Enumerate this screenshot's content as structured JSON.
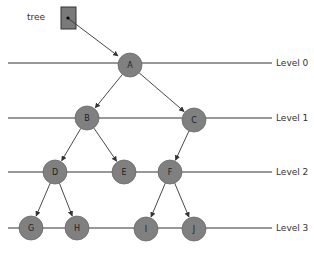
{
  "pointer": {
    "label": "tree"
  },
  "levels": [
    {
      "label": "Level 0",
      "y": 63
    },
    {
      "label": "Level 1",
      "y": 118
    },
    {
      "label": "Level 2",
      "y": 172
    },
    {
      "label": "Level 3",
      "y": 228
    }
  ],
  "nodes": [
    {
      "id": "A",
      "label": "A",
      "x": 130,
      "y": 65
    },
    {
      "id": "B",
      "label": "B",
      "x": 87,
      "y": 118
    },
    {
      "id": "C",
      "label": "C",
      "x": 194,
      "y": 120
    },
    {
      "id": "D",
      "label": "D",
      "x": 55,
      "y": 172
    },
    {
      "id": "E",
      "label": "E",
      "x": 124,
      "y": 172
    },
    {
      "id": "F",
      "label": "F",
      "x": 170,
      "y": 172
    },
    {
      "id": "G",
      "label": "G",
      "x": 31,
      "y": 228
    },
    {
      "id": "H",
      "label": "H",
      "x": 77,
      "y": 228
    },
    {
      "id": "I",
      "label": "I",
      "x": 146,
      "y": 229
    },
    {
      "id": "J",
      "label": "J",
      "x": 194,
      "y": 229
    }
  ],
  "edges": [
    [
      "A",
      "B"
    ],
    [
      "A",
      "C"
    ],
    [
      "B",
      "D"
    ],
    [
      "B",
      "E"
    ],
    [
      "C",
      "F"
    ],
    [
      "D",
      "G"
    ],
    [
      "D",
      "H"
    ],
    [
      "F",
      "I"
    ],
    [
      "F",
      "J"
    ]
  ],
  "colors": {
    "node_fill": "#808080",
    "node_stroke": "#6a6a6a",
    "line": "#333333",
    "box_fill": "#7a7a7a"
  }
}
